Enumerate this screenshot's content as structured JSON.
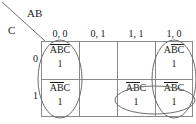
{
  "figure": {
    "type": "karnaugh-map",
    "variables_label_top": "AB",
    "variables_label_left": "C",
    "column_headers": [
      "0, 0",
      "0, 1",
      "1, 1",
      "1, 0"
    ],
    "row_headers": [
      "0",
      "1"
    ]
  },
  "cells": [
    {
      "id": "r0c0",
      "row": "0",
      "col": "0, 0",
      "term_parts": [
        {
          "text": "A",
          "bar": true
        },
        {
          "text": "B",
          "bar": true
        },
        {
          "text": "C",
          "bar": true
        }
      ],
      "value": "1"
    },
    {
      "id": "r0c1",
      "row": "0",
      "col": "0, 1",
      "term_parts": [],
      "value": ""
    },
    {
      "id": "r0c2",
      "row": "0",
      "col": "1, 1",
      "term_parts": [],
      "value": ""
    },
    {
      "id": "r0c3",
      "row": "0",
      "col": "1, 0",
      "term_parts": [
        {
          "text": "A",
          "bar": false
        },
        {
          "text": "B",
          "bar": true
        },
        {
          "text": "C",
          "bar": true
        }
      ],
      "value": "1"
    },
    {
      "id": "r1c0",
      "row": "1",
      "col": "0, 0",
      "term_parts": [
        {
          "text": "A",
          "bar": true
        },
        {
          "text": "B",
          "bar": true
        },
        {
          "text": "C",
          "bar": false
        }
      ],
      "value": "1"
    },
    {
      "id": "r1c1",
      "row": "1",
      "col": "0, 1",
      "term_parts": [],
      "value": ""
    },
    {
      "id": "r1c2",
      "row": "1",
      "col": "1, 1",
      "term_parts": [
        {
          "text": "A",
          "bar": true
        },
        {
          "text": "B",
          "bar": true
        },
        {
          "text": "C",
          "bar": false
        }
      ],
      "value": "1"
    },
    {
      "id": "r1c3",
      "row": "1",
      "col": "1, 0",
      "term_parts": [
        {
          "text": "A",
          "bar": true
        },
        {
          "text": "B",
          "bar": true
        },
        {
          "text": "C",
          "bar": false
        }
      ],
      "value": "1"
    }
  ],
  "groups": [
    {
      "name": "left-column-group",
      "cx": 60,
      "cy": 79,
      "rx": 22,
      "ry": 39
    },
    {
      "name": "right-column-group",
      "cx": 174,
      "cy": 79,
      "rx": 22,
      "ry": 39
    },
    {
      "name": "bottom-right-pair-group",
      "cx": 155,
      "cy": 100,
      "rx": 40,
      "ry": 14
    }
  ],
  "colors": {
    "grid_line": "#8a8a8a",
    "oval_stroke": "#6e6e6e",
    "text": "#1a1a1a",
    "background": "#ffffff"
  }
}
